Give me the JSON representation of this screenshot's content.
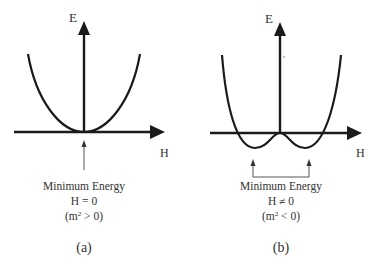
{
  "panels": [
    {
      "id": "a",
      "caption": "(a)",
      "y_axis_label": "E",
      "x_axis_label": "H",
      "annotation": {
        "line1": "Minimum Energy",
        "line2": "H = 0",
        "line3_prefix": "(m",
        "line3_sup": "2",
        "line3_suffix": " > 0)"
      },
      "curve": "single-well parabola, minimum at H = 0"
    },
    {
      "id": "b",
      "caption": "(b)",
      "y_axis_label": "E",
      "x_axis_label": "H",
      "annotation": {
        "line1": "Minimum Energy",
        "line2": "H ≠ 0",
        "line3_prefix": "(m",
        "line3_sup": "2",
        "line3_suffix": " < 0)"
      },
      "curve": "double-well (Mexican hat) potential, minima at H ≠ 0"
    }
  ],
  "colors": {
    "stroke": "#1a1a1a",
    "text": "#333333",
    "thin": "#555555"
  }
}
